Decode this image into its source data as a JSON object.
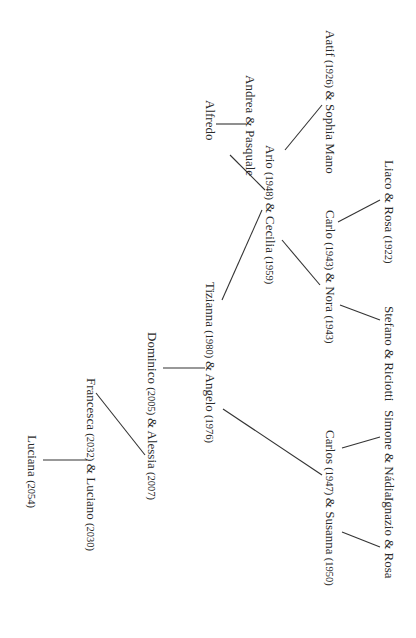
{
  "diagram": {
    "type": "family-tree",
    "orientation": "rotated-90-clockwise",
    "nodes": [
      {
        "id": "aatif",
        "name1": "Aatif",
        "year1": "(1926)",
        "amp": "&",
        "name2": "Sophia Mano",
        "year2": ""
      },
      {
        "id": "liaco",
        "name1": "Liaco",
        "year1": "",
        "amp": "&",
        "name2": "Rosa",
        "year2": "(1922)"
      },
      {
        "id": "stefano",
        "name1": "Stefano",
        "year1": "",
        "amp": "&",
        "name2": "Riciotti",
        "year2": ""
      },
      {
        "id": "simone",
        "name1": "Simone",
        "year1": "",
        "amp": "&",
        "name2": "Nádia",
        "year2": ""
      },
      {
        "id": "ignazio",
        "name1": "Ignazio",
        "year1": "",
        "amp": "&",
        "name2": "Rosa",
        "year2": ""
      },
      {
        "id": "andrea",
        "name1": "Andrea",
        "year1": "",
        "amp": "&",
        "name2": "Pasquale",
        "year2": ""
      },
      {
        "id": "alfredo",
        "name1": "Alfredo",
        "year1": "",
        "amp": "",
        "name2": "",
        "year2": ""
      },
      {
        "id": "ario",
        "name1": "Ario",
        "year1": "(1948)",
        "amp": "&",
        "name2": "Cecilia",
        "year2": "(1959)"
      },
      {
        "id": "carlo",
        "name1": "Carlo",
        "year1": "(1943)",
        "amp": "&",
        "name2": "Nora",
        "year2": "(1943)"
      },
      {
        "id": "tizianna",
        "name1": "Tizianna",
        "year1": "(1980)",
        "amp": "&",
        "name2": "Angelo",
        "year2": "(1976)"
      },
      {
        "id": "carlos",
        "name1": "Carlos",
        "year1": "(1947)",
        "amp": "&",
        "name2": "Susanna",
        "year2": "(1950)"
      },
      {
        "id": "dominico",
        "name1": "Dominico",
        "year1": "(2005)",
        "amp": "&",
        "name2": "Alessia",
        "year2": "(2007)"
      },
      {
        "id": "francesca",
        "name1": "Francesca",
        "year1": "(2032)",
        "amp": "&",
        "name2": "Luciano",
        "year2": "(2030)"
      },
      {
        "id": "luciana",
        "name1": "Luciana",
        "year1": "(2054)",
        "amp": "",
        "name2": "",
        "year2": ""
      }
    ],
    "edges": [
      {
        "parent": "aatif",
        "child": "ario"
      },
      {
        "parent": "andrea",
        "child": "ario"
      },
      {
        "parent": "andrea",
        "child": "alfredo"
      },
      {
        "parent": "liaco",
        "child": "carlo"
      },
      {
        "parent": "stefano",
        "child": "carlo"
      },
      {
        "parent": "ario",
        "child": "tizianna"
      },
      {
        "parent": "carlo",
        "child": "ario"
      },
      {
        "parent": "simone",
        "child": "carlos"
      },
      {
        "parent": "ignazio",
        "child": "carlos"
      },
      {
        "parent": "carlos",
        "child": "tizianna"
      },
      {
        "parent": "tizianna",
        "child": "dominico"
      },
      {
        "parent": "dominico",
        "child": "francesca"
      },
      {
        "parent": "francesca",
        "child": "luciana"
      }
    ],
    "colors": {
      "text": "#2a2a2a",
      "line": "#333333",
      "background": "#ffffff"
    }
  }
}
